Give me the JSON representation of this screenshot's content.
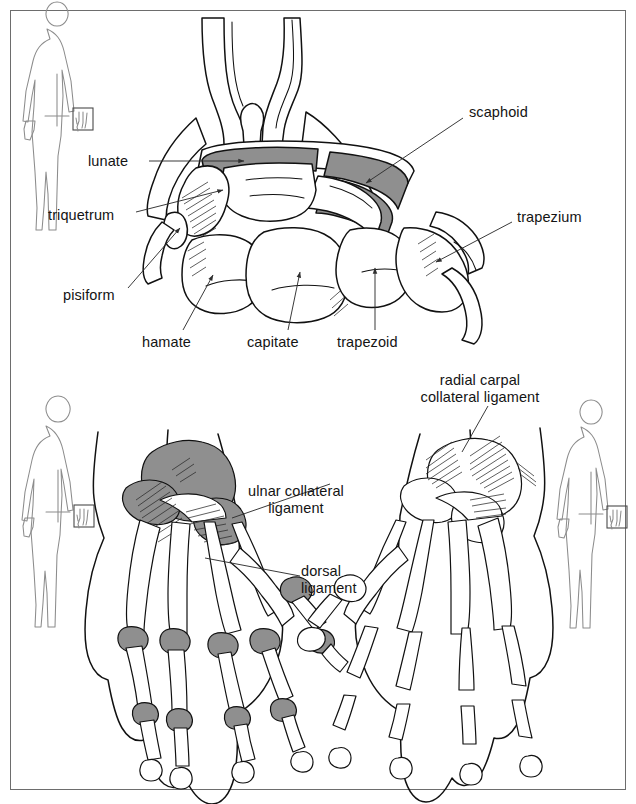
{
  "figure": {
    "border_color": "#6d6d6d",
    "background": "#ffffff",
    "cartilage_color": "#8f8f8f",
    "line_color": "#111111",
    "label_color": "#141414"
  },
  "panels": {
    "top": {
      "name": "Coronal section of the carpus showing individual carpal bones",
      "view": "anterior-posterior radiographic style section",
      "labels": [
        {
          "id": "lunate",
          "text": "lunate",
          "x": 88,
          "y": 161,
          "align": "left"
        },
        {
          "id": "triquetrum",
          "text": "triquetrum",
          "x": 48,
          "y": 215,
          "align": "left"
        },
        {
          "id": "pisiform",
          "text": "pisiform",
          "x": 63,
          "y": 295,
          "align": "left"
        },
        {
          "id": "hamate",
          "text": "hamate",
          "x": 142,
          "y": 342,
          "align": "left"
        },
        {
          "id": "capitate",
          "text": "capitate",
          "x": 247,
          "y": 342,
          "align": "left"
        },
        {
          "id": "trapezoid",
          "text": "trapezoid",
          "x": 337,
          "y": 342,
          "align": "left"
        },
        {
          "id": "scaphoid",
          "text": "scaphoid",
          "x": 469,
          "y": 112,
          "align": "left"
        },
        {
          "id": "trapezium",
          "text": "trapezium",
          "x": 517,
          "y": 217,
          "align": "left"
        }
      ]
    },
    "bottom_left": {
      "name": "Dorsal view of left hand with shaded ligaments and joint cartilage",
      "labels": [
        {
          "id": "ulnar-collateral-ligament",
          "lines": [
            "ulnar collateral",
            "ligament"
          ],
          "x": 248,
          "y": 490,
          "align": "left"
        },
        {
          "id": "dorsal-ligament",
          "lines": [
            "dorsal",
            "ligament"
          ],
          "x": 301,
          "y": 570,
          "align": "left"
        }
      ]
    },
    "bottom_right": {
      "name": "Dorsal view of right hand with radial carpal collateral ligament",
      "labels": [
        {
          "id": "radial-carpal-collateral-ligament",
          "lines": [
            "radial carpal",
            "collateral ligament"
          ],
          "x": 480,
          "y": 379,
          "align": "center"
        }
      ]
    }
  },
  "locator_figures": [
    {
      "id": "locator-top-left",
      "pose": "posterior standing body outline",
      "highlight": "left hand",
      "x": 20,
      "y": 18
    },
    {
      "id": "locator-mid-left",
      "pose": "posterior standing body outline",
      "highlight": "left hand",
      "x": 20,
      "y": 412
    },
    {
      "id": "locator-mid-right",
      "pose": "posterior standing body outline",
      "highlight": "left hand",
      "x": 553,
      "y": 412
    }
  ]
}
